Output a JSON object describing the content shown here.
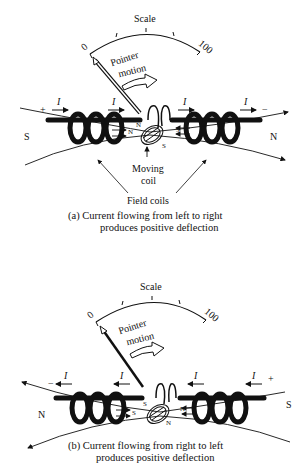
{
  "figure": {
    "panels": [
      {
        "id": "a",
        "scale_label": "Scale",
        "scale_min": "0",
        "scale_max": "100",
        "pointer_label_line1": "Pointer",
        "pointer_label_line2": "motion",
        "current_symbol": "I",
        "left_terminal": "+",
        "right_terminal": "−",
        "left_pole": "S",
        "right_pole": "N",
        "inner_left_pole": "N",
        "inner_right_pole": "S",
        "moving_coil_pole_top": "N",
        "moving_coil_pole_bottom": "S",
        "moving_coil_label_line1": "Moving",
        "moving_coil_label_line2": "coil",
        "field_coils_label": "Field coils",
        "caption_line1": "(a) Current flowing from left to right",
        "caption_line2": "produces positive deflection",
        "current_direction": "left-to-right"
      },
      {
        "id": "b",
        "scale_label": "Scale",
        "scale_min": "0",
        "scale_max": "100",
        "pointer_label_line1": "Pointer",
        "pointer_label_line2": "motion",
        "current_symbol": "I",
        "left_terminal": "−",
        "right_terminal": "+",
        "left_pole": "N",
        "right_pole": "S",
        "inner_left_pole": "S",
        "inner_right_pole": "N",
        "moving_coil_pole_top": "S",
        "moving_coil_pole_bottom": "N",
        "caption_line1": "(b) Current flowing from right to left",
        "caption_line2": "produces positive deflection",
        "current_direction": "right-to-left"
      }
    ]
  }
}
